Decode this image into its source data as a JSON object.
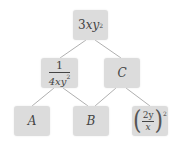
{
  "diagram": {
    "type": "tree",
    "nodes": [
      {
        "id": "root",
        "label": "3xy²",
        "coef": "3",
        "var": "xy",
        "exp": "2"
      },
      {
        "id": "left",
        "label": "1/(4xy²)",
        "num": "1",
        "den_var": "4xy",
        "den_exp": "2"
      },
      {
        "id": "C",
        "label": "C"
      },
      {
        "id": "A",
        "label": "A"
      },
      {
        "id": "B",
        "label": "B"
      },
      {
        "id": "right",
        "label": "(2y/x)²",
        "num": "2y",
        "den": "x",
        "exp": "2",
        "lparen": "(",
        "rparen": ")"
      }
    ],
    "edges": [
      [
        "root",
        "left"
      ],
      [
        "root",
        "C"
      ],
      [
        "left",
        "A"
      ],
      [
        "left",
        "B"
      ],
      [
        "C",
        "B"
      ],
      [
        "C",
        "right"
      ]
    ],
    "colors": {
      "box": "#dcdcdc",
      "line": "#9a9a9a",
      "text": "#444444"
    }
  }
}
